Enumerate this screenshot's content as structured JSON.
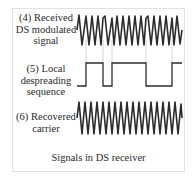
{
  "diagram": {
    "title": "Signals in DS receiver",
    "rows": [
      {
        "id": "received-signal",
        "number": "(4)",
        "label_lines": [
          "(4) Received",
          "DS modulated",
          "signal"
        ],
        "type": "phase-modulated sine"
      },
      {
        "id": "despreading-sequence",
        "number": "(5)",
        "label_lines": [
          "(5) Local",
          "despreading",
          "sequence"
        ],
        "type": "square wave"
      },
      {
        "id": "recovered-carrier",
        "number": "(6)",
        "label_lines": [
          "(6) Recovered",
          "carrier"
        ],
        "type": "sine"
      }
    ],
    "sequence_levels": [
      "low",
      "high",
      "low",
      "high",
      "low",
      "high"
    ],
    "colors": {
      "waveform": "#2b2b2b",
      "guide_lines": "#bdbdbd",
      "frame": "#e2e2e2",
      "text": "#2a2a2a"
    }
  }
}
